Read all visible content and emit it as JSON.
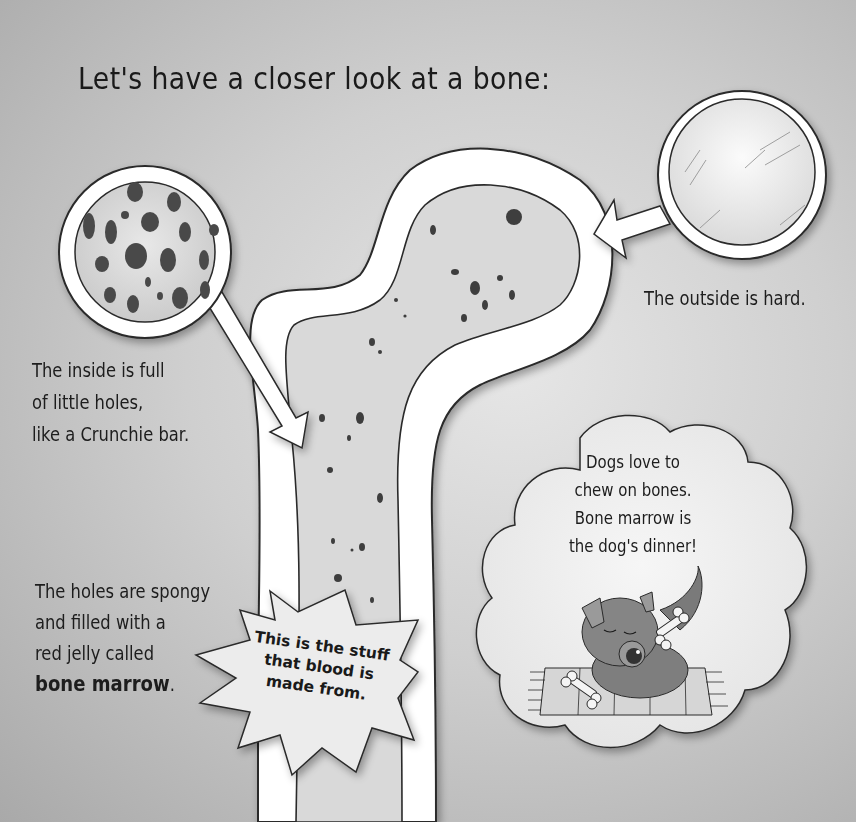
{
  "page": {
    "title": "Let's have a closer look at a bone:",
    "background_colors": {
      "center": "#e6e6e6",
      "edge": "#a9a9a9"
    }
  },
  "captions": {
    "inside": {
      "lines": [
        "The inside is full",
        "of little holes,",
        "like a Crunchie bar."
      ]
    },
    "outside": {
      "text": "The outside is hard."
    },
    "marrow": {
      "lines": [
        "The holes are spongy",
        "and filled with a",
        "red jelly called"
      ],
      "emphasis": "bone marrow",
      "emphasis_suffix": "."
    }
  },
  "starburst": {
    "lines": [
      "This is the stuff",
      "that blood is",
      "made from."
    ]
  },
  "thought_cloud": {
    "lines": [
      "Dogs love to",
      "chew on bones.",
      "Bone marrow is",
      "the dog's dinner!"
    ]
  },
  "illustrations": {
    "bone": "bone-cross-section",
    "magnifier_inside": "spongy-bone-magnifier",
    "magnifier_outside": "hard-bone-magnifier",
    "dog": "dog-chewing-bone-on-rug"
  },
  "colors": {
    "ink": "#1a1a1a",
    "bone_white": "#ffffff",
    "hole": "#4a4a4a"
  }
}
